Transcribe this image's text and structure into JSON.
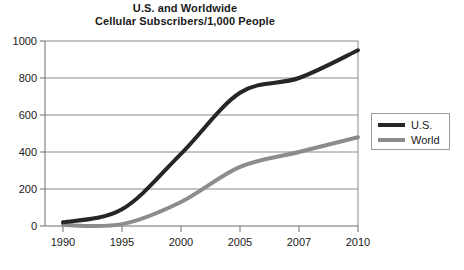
{
  "chart_data": {
    "type": "line",
    "title": "U.S. and Worldwide Cellular Subscribers/1,000 People",
    "title_lines": [
      "U.S. and Worldwide",
      "Cellular Subscribers/1,000 People"
    ],
    "xlabel": "",
    "ylabel": "",
    "categories": [
      "1990",
      "1995",
      "2000",
      "2005",
      "2007",
      "2010"
    ],
    "x_tick_labels": [
      "1990",
      "1995",
      "2000",
      "2005",
      "2007",
      "2010"
    ],
    "y_tick_labels": [
      "0",
      "200",
      "400",
      "600",
      "800",
      "1000"
    ],
    "y_ticks": [
      0,
      200,
      400,
      600,
      800,
      1000
    ],
    "ylim": [
      0,
      1000
    ],
    "grid": "horizontal",
    "legend_position": "right",
    "series": [
      {
        "name": "U.S.",
        "color": "#262626",
        "values": [
          20,
          90,
          390,
          720,
          800,
          950
        ]
      },
      {
        "name": "World",
        "color": "#8c8c8c",
        "values": [
          5,
          10,
          130,
          320,
          400,
          480
        ]
      }
    ]
  },
  "legend": {
    "entries": [
      {
        "label": "U.S.",
        "color": "#262626"
      },
      {
        "label": "World",
        "color": "#8c8c8c"
      }
    ]
  },
  "colors": {
    "us_line": "#262626",
    "world_line": "#8c8c8c",
    "gridline": "#8a8a8a",
    "axis": "#6e6e6e",
    "text": "#1a1a1a",
    "background": "#ffffff"
  }
}
